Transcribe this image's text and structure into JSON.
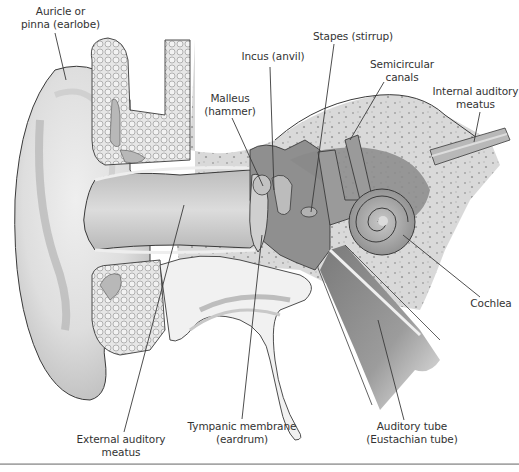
{
  "diagram": {
    "labels": {
      "auricle": {
        "line1": "Auricle or",
        "line2": "pinna (earlobe)"
      },
      "incus": {
        "line1": "Incus (anvil)"
      },
      "stapes": {
        "line1": "Stapes (stirrup)"
      },
      "semicircular": {
        "line1": "Semicircular",
        "line2": "canals"
      },
      "internal_meatus": {
        "line1": "Internal auditory",
        "line2": "meatus"
      },
      "malleus": {
        "line1": "Malleus",
        "line2": "(hammer)"
      },
      "cochlea": {
        "line1": "Cochlea"
      },
      "tympanic": {
        "line1": "Tympanic membrane",
        "line2": "(eardrum)"
      },
      "external_meatus": {
        "line1": "External auditory",
        "line2": "meatus"
      },
      "auditory_tube": {
        "line1": "Auditory tube",
        "line2": "(Eustachian tube)"
      }
    },
    "colors": {
      "background": "#ffffff",
      "outline": "#3a3a3a",
      "skin_light": "#e4e4e4",
      "skin_mid": "#c9c9c9",
      "bone": "#d6d6d6",
      "cavity_dark": "#8a8a8a",
      "label_text": "#333333"
    }
  }
}
